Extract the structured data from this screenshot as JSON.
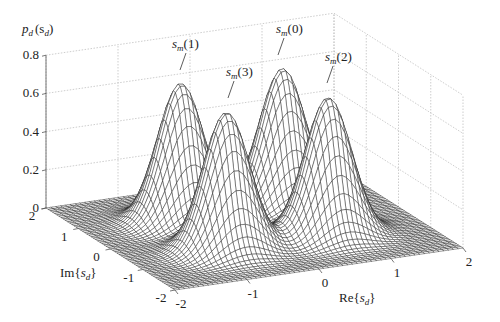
{
  "chart_data": {
    "type": "surface3d",
    "title": "",
    "zlabel": "p_d(s_d)",
    "xlabel": "Re{s_d}",
    "ylabel": "Im{s_d}",
    "x_ticks": [
      "-2",
      "-1",
      "0",
      "1",
      "2"
    ],
    "y_ticks": [
      "-2",
      "-1",
      "0",
      "1",
      "2"
    ],
    "z_ticks": [
      "0",
      "0.2",
      "0.4",
      "0.6",
      "0.8"
    ],
    "xlim": [
      -2,
      2
    ],
    "ylim": [
      -2,
      2
    ],
    "zlim": [
      0,
      0.8
    ],
    "grid": true,
    "peaks": [
      {
        "label": "s_m(0)",
        "re": 0.707,
        "im": 0.707,
        "height": 0.72
      },
      {
        "label": "s_m(1)",
        "re": -0.707,
        "im": 0.707,
        "height": 0.72
      },
      {
        "label": "s_m(2)",
        "re": 0.707,
        "im": -0.707,
        "height": 0.72
      },
      {
        "label": "s_m(3)",
        "re": -0.707,
        "im": -0.707,
        "height": 0.72
      }
    ],
    "sigma": 0.3
  },
  "labels": {
    "zlabel_main": "p",
    "zlabel_sub": "d",
    "zlabel_arg": "(s",
    "zlabel_arg_sub": "d",
    "zlabel_close": ")",
    "re_prefix": "Re{",
    "im_prefix": "Im{",
    "s": "s",
    "d": "d",
    "close_brace": "}",
    "m": "m"
  },
  "annotations": [
    {
      "name": "s_m(1)",
      "index": "(1)"
    },
    {
      "name": "s_m(0)",
      "index": "(0)"
    },
    {
      "name": "s_m(3)",
      "index": "(3)"
    },
    {
      "name": "s_m(2)",
      "index": "(2)"
    }
  ]
}
